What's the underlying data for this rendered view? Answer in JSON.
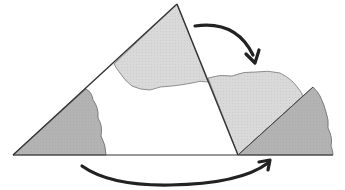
{
  "diagram": {
    "title": "Triangle angle sum: torn corners rearranged along a straight line",
    "colors": {
      "background": "#ffffff",
      "outline": "#333333",
      "light_fill": "#d9d9d9",
      "dark_fill": "#b3b3b3",
      "arrow": "#222222"
    },
    "triangle": {
      "vertices": [
        [
          13,
          155
        ],
        [
          177,
          4
        ],
        [
          238,
          155
        ]
      ]
    },
    "pieces": [
      {
        "name": "left-corner-piece",
        "shade": "dark"
      },
      {
        "name": "top-corner-piece",
        "shade": "light"
      },
      {
        "name": "moved-top-corner-piece",
        "shade": "light"
      },
      {
        "name": "moved-left-corner-piece",
        "shade": "dark"
      }
    ],
    "arrows": [
      {
        "name": "top-arrow",
        "direction": "clockwise-down"
      },
      {
        "name": "bottom-arrow",
        "direction": "left-to-right"
      }
    ]
  }
}
